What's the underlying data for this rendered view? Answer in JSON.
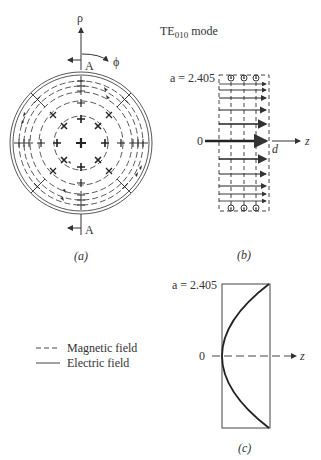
{
  "title": {
    "prefix": "TE",
    "subscript": "010",
    "suffix": " mode"
  },
  "panel_a": {
    "caption": "(a)",
    "axis_rho": "ρ",
    "axis_phi": "ϕ",
    "section_top": "A",
    "section_bottom": "A"
  },
  "panel_b": {
    "caption": "(b)",
    "top_label": "a = 2.405",
    "origin_label": "0",
    "length_label": "d",
    "axis_label": "z"
  },
  "panel_c": {
    "caption": "(c)",
    "top_label": "a = 2.405",
    "origin_label": "0",
    "axis_label": "z"
  },
  "legend": {
    "items": [
      {
        "style": "dashed",
        "label": "Magnetic field"
      },
      {
        "style": "solid",
        "label": "Electric field"
      }
    ]
  },
  "colors": {
    "ink": "#333333",
    "background": "#ffffff"
  }
}
